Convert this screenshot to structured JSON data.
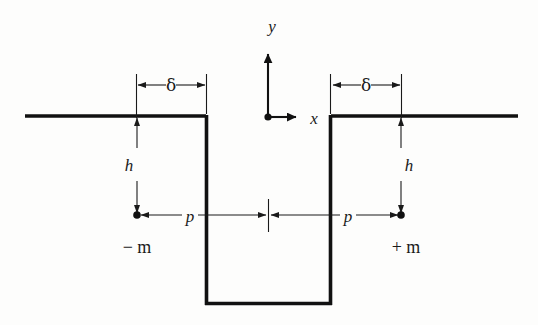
{
  "figure": {
    "domain": "Diagram",
    "background_color": "#fdfdfc",
    "ink_color": "#111111"
  },
  "axes": {
    "y_axis": {
      "label": "y",
      "direction": "up",
      "origin_x": 268,
      "origin_y": 117,
      "tip_y": 48
    },
    "x_axis": {
      "label": "x",
      "direction": "right",
      "origin_x": 268,
      "origin_y": 117,
      "tip_x": 303
    },
    "origin_marker": "origin-dot"
  },
  "labels": {
    "y": "y",
    "x": "x",
    "delta_left": "δ",
    "delta_right": "δ",
    "h_left": "h",
    "h_right": "h",
    "p_left": "p",
    "p_right": "p",
    "minus_m": "− m",
    "plus_m": "+ m"
  },
  "geometry": {
    "surface_y": 116,
    "left_surface_start_x": 25,
    "left_surface_end_x": 206,
    "right_surface_start_x": 331,
    "right_surface_end_x": 518,
    "trench_left_wall_x": 206,
    "trench_right_wall_x": 331,
    "trench_bottom_y": 305,
    "dipole_level_y": 215,
    "delta_dim_y": 85,
    "left_marker_x": 137,
    "right_marker_x": 401,
    "center_tick_x": 268
  },
  "dimensions": [
    {
      "name": "delta-left",
      "symbol": "δ",
      "from_x": 136,
      "to_x": 206,
      "at_y": 85,
      "arrows": "both"
    },
    {
      "name": "delta-right",
      "symbol": "δ",
      "from_x": 331,
      "to_x": 401,
      "at_y": 85,
      "arrows": "both"
    },
    {
      "name": "h-left",
      "symbol": "h",
      "at_x": 137,
      "from_y": 116,
      "to_y": 215,
      "arrows": "both"
    },
    {
      "name": "h-right",
      "symbol": "h",
      "at_x": 401,
      "from_y": 116,
      "to_y": 215,
      "arrows": "both"
    },
    {
      "name": "p-left",
      "symbol": "p",
      "from_x": 137,
      "to_x": 268,
      "at_y": 215,
      "arrows": "both"
    },
    {
      "name": "p-right",
      "symbol": "p",
      "from_x": 268,
      "to_x": 401,
      "at_y": 215,
      "arrows": "both"
    }
  ],
  "markers": [
    {
      "name": "minus-m",
      "label": "− m",
      "x": 137,
      "y": 215
    },
    {
      "name": "plus-m",
      "label": "+ m",
      "x": 401,
      "y": 215
    },
    {
      "name": "origin",
      "label": "",
      "x": 268,
      "y": 117
    }
  ]
}
